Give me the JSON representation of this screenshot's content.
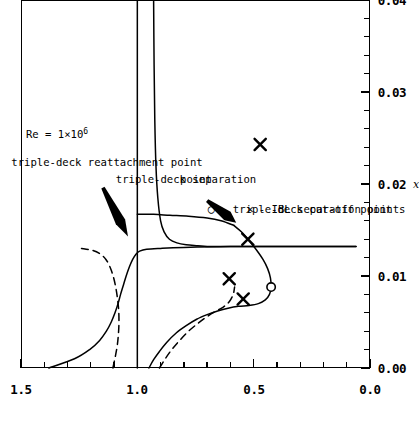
{
  "chart_data": {
    "type": "line",
    "title": "",
    "xlabel": "α",
    "ylabel": "x",
    "xlim": [
      0.0,
      0.04
    ],
    "ylim": [
      0.0,
      1.5
    ],
    "xticks": [
      "0.00",
      "0.01",
      "0.02",
      "0.03",
      "0.04"
    ],
    "xtick_values": [
      0.0,
      0.01,
      0.02,
      0.03,
      0.04
    ],
    "yticks": [
      "0.0",
      "0.5",
      "1.0",
      "1.5"
    ],
    "ytick_values": [
      0.0,
      0.5,
      1.0,
      1.5
    ],
    "xminor_count": 4,
    "yminor_count": 4,
    "grid": false,
    "legend_position": "lower-right-inside",
    "series": [
      {
        "name": "triple-deck reattachment point",
        "style": "solid",
        "points": [
          [
            0.0,
            1.38
          ],
          [
            0.001,
            1.27
          ],
          [
            0.002,
            1.205
          ],
          [
            0.003,
            1.162
          ],
          [
            0.004,
            1.133
          ],
          [
            0.005,
            1.112
          ],
          [
            0.006,
            1.096
          ],
          [
            0.007,
            1.083
          ],
          [
            0.008,
            1.072
          ],
          [
            0.009,
            1.06
          ],
          [
            0.01,
            1.048
          ],
          [
            0.011,
            1.034
          ],
          [
            0.0118,
            1.02
          ],
          [
            0.0124,
            1.005
          ],
          [
            0.0127,
            0.99
          ],
          [
            0.0129,
            0.96
          ],
          [
            0.013,
            0.9
          ],
          [
            0.0131,
            0.8
          ],
          [
            0.0132,
            0.6
          ],
          [
            0.0132,
            0.4
          ],
          [
            0.0132,
            0.2
          ],
          [
            0.0132,
            0.06
          ]
        ]
      },
      {
        "name": "triple-deck reattachment point (upper branch, dashed)",
        "style": "dashed",
        "points": [
          [
            0.0,
            1.105
          ],
          [
            0.0012,
            1.095
          ],
          [
            0.0025,
            1.086
          ],
          [
            0.0038,
            1.081
          ],
          [
            0.005,
            1.079
          ],
          [
            0.0062,
            1.08
          ],
          [
            0.0075,
            1.085
          ],
          [
            0.0088,
            1.093
          ],
          [
            0.01,
            1.104
          ],
          [
            0.011,
            1.118
          ],
          [
            0.0118,
            1.135
          ],
          [
            0.0124,
            1.16
          ],
          [
            0.0128,
            1.195
          ],
          [
            0.013,
            1.24
          ]
        ]
      },
      {
        "name": "triple-deck separation point",
        "style": "solid",
        "points": [
          [
            0.0,
            0.95
          ],
          [
            0.0009,
            0.93
          ],
          [
            0.0018,
            0.905
          ],
          [
            0.0028,
            0.873
          ],
          [
            0.0038,
            0.833
          ],
          [
            0.0046,
            0.79
          ],
          [
            0.0053,
            0.745
          ],
          [
            0.0058,
            0.7
          ],
          [
            0.0062,
            0.655
          ],
          [
            0.0065,
            0.61
          ],
          [
            0.0067,
            0.565
          ],
          [
            0.0068,
            0.52
          ],
          [
            0.007,
            0.48
          ],
          [
            0.0074,
            0.45
          ],
          [
            0.008,
            0.432
          ],
          [
            0.0088,
            0.425
          ],
          [
            0.0098,
            0.428
          ],
          [
            0.0108,
            0.44
          ],
          [
            0.0118,
            0.46
          ],
          [
            0.0128,
            0.487
          ],
          [
            0.0138,
            0.518
          ],
          [
            0.0148,
            0.553
          ],
          [
            0.0155,
            0.585
          ]
        ]
      },
      {
        "name": "triple-deck separation point (dashed branch)",
        "style": "dashed",
        "points": [
          [
            0.0,
            0.905
          ],
          [
            0.001,
            0.88
          ],
          [
            0.002,
            0.852
          ],
          [
            0.003,
            0.818
          ],
          [
            0.004,
            0.78
          ],
          [
            0.0048,
            0.742
          ],
          [
            0.0055,
            0.705
          ],
          [
            0.0061,
            0.668
          ],
          [
            0.0066,
            0.632
          ],
          [
            0.0072,
            0.605
          ],
          [
            0.008,
            0.588
          ],
          [
            0.0088,
            0.582
          ]
        ]
      },
      {
        "name": "separation branch rising to asymptote",
        "style": "solid",
        "points": [
          [
            0.04,
            0.93
          ],
          [
            0.033,
            0.928
          ],
          [
            0.027,
            0.925
          ],
          [
            0.022,
            0.92
          ],
          [
            0.0185,
            0.912
          ],
          [
            0.016,
            0.9
          ],
          [
            0.0148,
            0.885
          ],
          [
            0.014,
            0.862
          ],
          [
            0.0136,
            0.83
          ],
          [
            0.0134,
            0.79
          ],
          [
            0.0133,
            0.74
          ],
          [
            0.0132,
            0.68
          ],
          [
            0.0132,
            0.6
          ],
          [
            0.0132,
            0.48
          ],
          [
            0.0132,
            0.33
          ],
          [
            0.0132,
            0.18
          ],
          [
            0.0132,
            0.06
          ]
        ]
      },
      {
        "name": "cut-off curve right branch",
        "style": "solid",
        "points": [
          [
            0.0155,
            0.585
          ],
          [
            0.016,
            0.64
          ],
          [
            0.0163,
            0.7
          ],
          [
            0.0165,
            0.78
          ],
          [
            0.0166,
            0.86
          ],
          [
            0.0167,
            0.93
          ],
          [
            0.0167,
            1.0
          ]
        ]
      },
      {
        "name": "horizontal reference line x = 1.0",
        "style": "solid-reference",
        "points": [
          [
            0.0,
            1.0
          ],
          [
            0.04,
            1.0
          ]
        ]
      }
    ],
    "markers": [
      {
        "symbol": "circle",
        "label": "triple-deck cut-off point",
        "points": [
          [
            0.0088,
            0.425
          ]
        ]
      },
      {
        "symbol": "cross",
        "label": "IBL separation points",
        "points": [
          [
            0.0075,
            0.545
          ],
          [
            0.0097,
            0.605
          ],
          [
            0.014,
            0.525
          ],
          [
            0.0243,
            0.472
          ]
        ]
      }
    ],
    "annotations": [
      {
        "id": "reynolds",
        "text": "Re = 1×10⁶",
        "lines": [
          "Re = 1×10"
        ],
        "superscript": "6",
        "arrow": false
      },
      {
        "id": "reattachment",
        "lines": [
          "triple-deck reattachment point"
        ],
        "arrow": true
      },
      {
        "id": "separation",
        "lines": [
          "triple-deck separation",
          "point"
        ],
        "arrow": true
      }
    ]
  },
  "axes": {
    "x_label": "α",
    "y_label": "x",
    "x_ticks": [
      "0.00",
      "0.01",
      "0.02",
      "0.03",
      "0.04"
    ],
    "y_ticks": [
      "0.0",
      "0.5",
      "1.0",
      "1.5"
    ]
  },
  "annotations": {
    "reynolds_prefix": "Re = 1×10",
    "reynolds_exponent": "6",
    "reattachment": "triple-deck reattachment point",
    "separation_line1": "triple-deck separation",
    "separation_line2": "point"
  },
  "legend": {
    "items": [
      {
        "glyph": "○",
        "symbol_name": "circle-marker",
        "text": "- triple-deck cut-off point"
      },
      {
        "glyph": "✕",
        "symbol_name": "cross-marker",
        "text": "- IBL separation points"
      }
    ]
  },
  "colors": {
    "ink": "#000000",
    "paper": "#ffffff"
  }
}
